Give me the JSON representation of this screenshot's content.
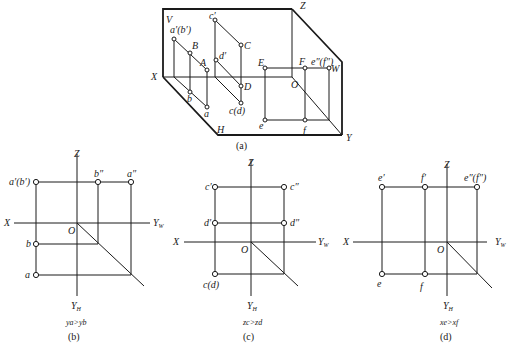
{
  "figure": {
    "panel_a": {
      "caption": "(a)",
      "plane_labels": {
        "V": "V",
        "H": "H",
        "W": "W"
      },
      "axis_labels": {
        "X": "X",
        "Y": "Y",
        "Z": "Z",
        "O": "O"
      },
      "points": {
        "a_prime_b_prime": "a′(b′)",
        "B": "B",
        "A": "A",
        "c_prime": "c′",
        "C": "C",
        "d_prime": "d′",
        "D": "D",
        "b": "b",
        "a": "a",
        "c_d": "c(d)",
        "E": "E",
        "F": "F",
        "e_dd_f_dd": "e″(f″)",
        "e": "e",
        "f": "f"
      }
    },
    "panel_b": {
      "caption": "(b)",
      "condition": "ya>yb",
      "axis_labels": {
        "Z": "Z",
        "X": "X",
        "O": "O",
        "YW": "Y",
        "YW_sub": "W",
        "YH": "Y",
        "YH_sub": "H"
      },
      "points": {
        "a_prime_b_prime": "a′(b′)",
        "b_dd": "b″",
        "a_dd": "a″",
        "b": "b",
        "a": "a"
      }
    },
    "panel_c": {
      "caption": "(c)",
      "condition": "zc>zd",
      "axis_labels": {
        "Z": "Z",
        "X": "X",
        "O": "O",
        "YW": "Y",
        "YW_sub": "W",
        "YH": "Y",
        "YH_sub": "H"
      },
      "points": {
        "c_prime": "c′",
        "c_dd": "c″",
        "d_prime": "d′",
        "d_dd": "d″",
        "c_d": "c(d)"
      }
    },
    "panel_d": {
      "caption": "(d)",
      "condition": "xe>xf",
      "axis_labels": {
        "Z": "Z",
        "X": "X",
        "O": "O",
        "YW": "Y",
        "YW_sub": "W",
        "YH": "Y",
        "YH_sub": "H"
      },
      "points": {
        "e_prime": "e′",
        "f_prime": "f′",
        "e_dd_f_dd": "e″(f″)",
        "e": "e",
        "f": "f"
      }
    }
  }
}
